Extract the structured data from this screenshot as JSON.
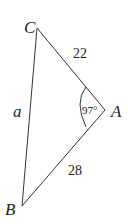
{
  "diagram": {
    "type": "triangle",
    "vertices": [
      {
        "name": "C",
        "x": 37,
        "y": 28
      },
      {
        "name": "A",
        "x": 105,
        "y": 110
      },
      {
        "name": "B",
        "x": 22,
        "y": 206
      }
    ],
    "labels": {
      "C": "C",
      "A": "A",
      "B": "B",
      "side_CB": "a",
      "side_CA": "22",
      "side_AB": "28",
      "angle_A": "97°"
    },
    "line_color": "#333333"
  }
}
